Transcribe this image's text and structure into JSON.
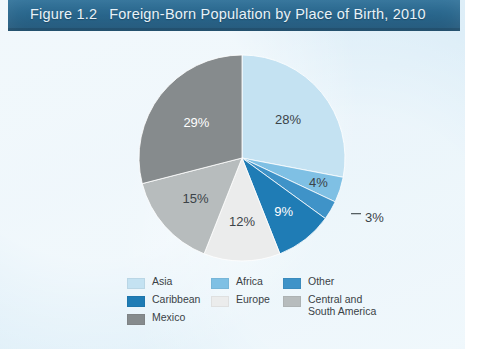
{
  "figure": {
    "number": "Figure 1.2",
    "title": "Foreign-Born Population by Place of Birth, 2010",
    "header_bg": "#2a6a93",
    "header_text_color": "#e8f2f8",
    "background": "#e2f0f8"
  },
  "chart_data": {
    "type": "pie",
    "title": "Foreign-Born Population by Place of Birth, 2010",
    "subtitle": "",
    "xlabel": "",
    "ylabel": "",
    "unit": "percent",
    "start_angle_deg": 0,
    "direction": "clockwise",
    "legend_position": "bottom",
    "grid": false,
    "categories": [
      "Asia",
      "Africa",
      "Other",
      "Caribbean",
      "Europe",
      "Central and South America",
      "Mexico"
    ],
    "values": [
      28,
      4,
      3,
      9,
      12,
      15,
      29
    ],
    "labels": [
      "28%",
      "4%",
      "3%",
      "9%",
      "12%",
      "15%",
      "29%"
    ],
    "colors": [
      "#c4e2f2",
      "#7fc0e4",
      "#3f93c8",
      "#1f7cb5",
      "#ebecec",
      "#b7bcbd",
      "#868b8d"
    ],
    "label_colors": [
      "#3b4348",
      "#3b4348",
      "#3b4348",
      "#ffffff",
      "#3b4348",
      "#3b4348",
      "#ffffff"
    ],
    "slices": [
      {
        "name": "Asia",
        "value": 28,
        "label": "28%",
        "color": "#c4e2f2"
      },
      {
        "name": "Africa",
        "value": 4,
        "label": "4%",
        "color": "#7fc0e4"
      },
      {
        "name": "Other",
        "value": 3,
        "label": "3%",
        "color": "#3f93c8",
        "callout": true
      },
      {
        "name": "Caribbean",
        "value": 9,
        "label": "9%",
        "color": "#1f7cb5"
      },
      {
        "name": "Europe",
        "value": 12,
        "label": "12%",
        "color": "#ebecec"
      },
      {
        "name": "Central and South America",
        "value": 15,
        "label": "15%",
        "color": "#b7bcbd"
      },
      {
        "name": "Mexico",
        "value": 29,
        "label": "29%",
        "color": "#868b8d"
      }
    ]
  },
  "labels": {
    "asia": "28%",
    "africa": "4%",
    "other": "3%",
    "caribbean": "9%",
    "europe": "12%",
    "central_south_america": "15%",
    "mexico": "29%"
  },
  "legend": {
    "columns": [
      {
        "items": [
          {
            "label": "Asia",
            "color": "#c4e2f2"
          },
          {
            "label": "Caribbean",
            "color": "#1f7cb5"
          },
          {
            "label": "Mexico",
            "color": "#868b8d"
          }
        ]
      },
      {
        "items": [
          {
            "label": "Africa",
            "color": "#7fc0e4"
          },
          {
            "label": "Europe",
            "color": "#ebecec"
          }
        ]
      },
      {
        "items": [
          {
            "label": "Other",
            "color": "#3f93c8"
          },
          {
            "label": "Central and\nSouth America",
            "color": "#b7bcbd"
          }
        ]
      }
    ]
  }
}
